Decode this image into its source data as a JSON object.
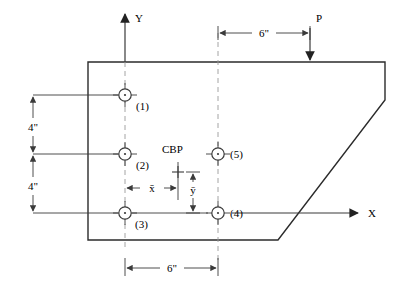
{
  "diagram": {
    "colors": {
      "line": "#3a3a3a",
      "outline": "#2b2b2b",
      "text": "#000000",
      "background": "#ffffff"
    },
    "axes": {
      "x_label": "X",
      "y_label": "Y",
      "origin_note": "axes origin at bolt (3) column and bolt (3)/(4) row"
    },
    "plate": {
      "name": "bracket-plate",
      "outline_note": "rectangular plate with lower-right diagonal chamfer"
    },
    "load": {
      "label": "P",
      "direction": "downward",
      "applied_on": "top edge"
    },
    "centroid": {
      "label": "CBP",
      "marker": "plus-cross",
      "meaning": "centroid of bolt pattern"
    },
    "bolts": [
      {
        "id": "1",
        "label": "(1)"
      },
      {
        "id": "2",
        "label": "(2)"
      },
      {
        "id": "3",
        "label": "(3)"
      },
      {
        "id": "4",
        "label": "(4)"
      },
      {
        "id": "5",
        "label": "(5)"
      }
    ],
    "dimensions": [
      {
        "name": "vertical-upper",
        "label": "4\"",
        "orientation": "vertical",
        "from": "bolt (1) row",
        "to": "bolt (2) row"
      },
      {
        "name": "vertical-lower",
        "label": "4\"",
        "orientation": "vertical",
        "from": "bolt (2) row",
        "to": "bolt (3) row"
      },
      {
        "name": "horizontal-bottom",
        "label": "6\"",
        "orientation": "horizontal",
        "from": "bolt (3) column",
        "to": "bolt (4) column"
      },
      {
        "name": "horizontal-top",
        "label": "6\"",
        "orientation": "horizontal",
        "from": "bolt (5) column",
        "to": "load P line"
      },
      {
        "name": "x-bar",
        "label": "x̄",
        "orientation": "horizontal",
        "from": "bolt column (1)(2)(3)",
        "to": "CBP"
      },
      {
        "name": "y-bar",
        "label": "ȳ",
        "orientation": "vertical",
        "from": "CBP",
        "to": "bolt (3)(4) row"
      }
    ]
  }
}
